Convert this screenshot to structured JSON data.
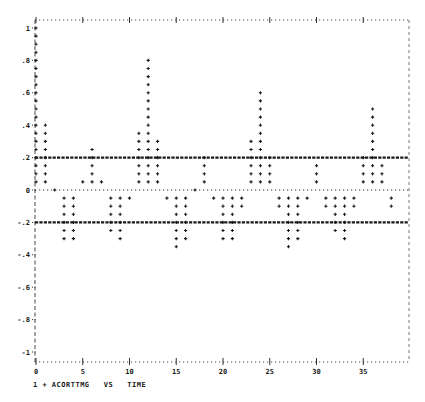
{
  "chart_data": {
    "type": "scatter",
    "style": "line-printer correlogram (stacked + markers)",
    "title": "",
    "legend": "1 + ACORTTMG VS TIME",
    "legend_entries": [
      {
        "id": "1",
        "marker": "+",
        "name": "ACORTTMG"
      }
    ],
    "xlabel": "TIME",
    "ylabel": "ACORTTMG",
    "xlim": [
      0,
      39
    ],
    "ylim": [
      -1,
      1
    ],
    "x_ticks": [
      0,
      5,
      10,
      15,
      20,
      25,
      30,
      35
    ],
    "x_tick_labels": [
      "0",
      "5",
      "10",
      "15",
      "20",
      "25",
      "30",
      "35"
    ],
    "y_ticks": [
      1,
      0.8,
      0.6,
      0.4,
      0.2,
      0,
      -0.2,
      -0.4,
      -0.6,
      -0.8,
      -1
    ],
    "y_tick_labels": [
      "1",
      ".8",
      ".6",
      ".4",
      ".2",
      "0",
      "-.2",
      "-.4",
      "-.6",
      "-.8",
      "-1"
    ],
    "reference_lines": [
      {
        "y": 0.2,
        "style": "dashed-bold",
        "label": "upper confidence bound"
      },
      {
        "y": -0.2,
        "style": "dashed-bold",
        "label": "lower confidence bound"
      },
      {
        "y": 0,
        "style": "dotted",
        "label": "zero line"
      }
    ],
    "grid": false,
    "x": [
      0,
      1,
      2,
      3,
      4,
      5,
      6,
      7,
      8,
      9,
      10,
      11,
      12,
      13,
      14,
      15,
      16,
      17,
      18,
      19,
      20,
      21,
      22,
      23,
      24,
      25,
      26,
      27,
      28,
      29,
      30,
      31,
      32,
      33,
      34,
      35,
      36,
      37,
      38
    ],
    "values": [
      1.0,
      0.4,
      0.0,
      -0.3,
      -0.3,
      0.05,
      0.25,
      0.05,
      -0.25,
      -0.3,
      -0.05,
      0.35,
      0.8,
      0.3,
      -0.05,
      -0.35,
      -0.3,
      0.0,
      0.2,
      -0.05,
      -0.3,
      -0.3,
      -0.1,
      0.3,
      0.6,
      0.2,
      -0.1,
      -0.35,
      -0.3,
      -0.05,
      0.15,
      -0.1,
      -0.25,
      -0.3,
      -0.1,
      0.2,
      0.5,
      0.15,
      -0.1
    ]
  },
  "caption": "1 + ACORTTMG   VS   TIME"
}
